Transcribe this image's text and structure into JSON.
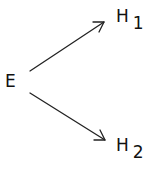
{
  "diagram": {
    "type": "directed-graph",
    "nodes": [
      {
        "id": "E",
        "label": "E",
        "subscript": ""
      },
      {
        "id": "H1",
        "label": "H",
        "subscript": "1"
      },
      {
        "id": "H2",
        "label": "H",
        "subscript": "2"
      }
    ],
    "edges": [
      {
        "from": "E",
        "to": "H1"
      },
      {
        "from": "E",
        "to": "H2"
      }
    ],
    "colors": {
      "stroke": "#222222",
      "text": "#111111",
      "background": "#ffffff"
    }
  }
}
